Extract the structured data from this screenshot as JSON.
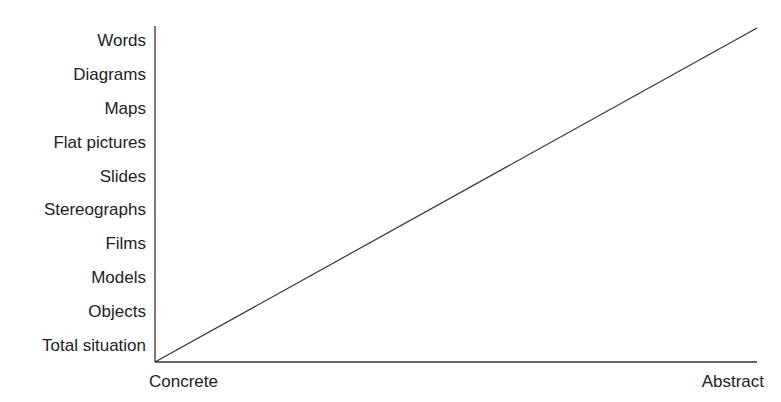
{
  "chart_data": {
    "type": "line",
    "title": "",
    "xlabel": "",
    "ylabel": "",
    "x_tick_labels": [
      "Concrete",
      "Abstract"
    ],
    "y_categories": [
      "Total situation",
      "Objects",
      "Models",
      "Films",
      "Stereographs",
      "Slides",
      "Flat pictures",
      "Maps",
      "Diagrams",
      "Words"
    ],
    "series": [
      {
        "name": "concreteness-to-abstraction",
        "x": [
          0,
          1
        ],
        "y": [
          0,
          1
        ]
      }
    ],
    "xlim": [
      0,
      1
    ],
    "ylim": [
      0,
      1
    ],
    "grid": false,
    "legend": "none",
    "colors": {
      "axis": "#333333",
      "line": "#333333",
      "text": "#222222"
    }
  }
}
